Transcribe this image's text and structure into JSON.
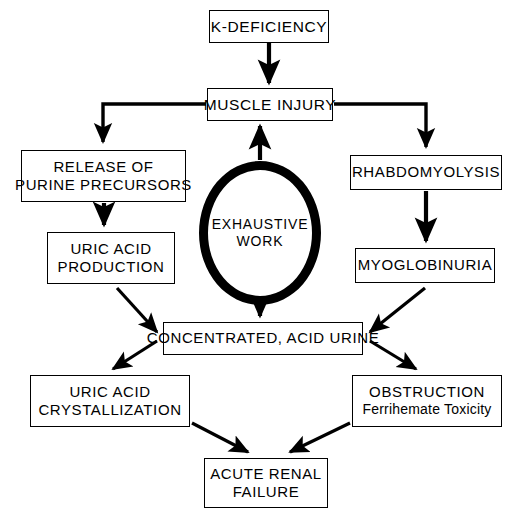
{
  "diagram": {
    "background_color": "#ffffff",
    "line_color": "#000000",
    "nodes": [
      {
        "id": "k_deficiency",
        "shape": "rect",
        "line1": "K-DEFICIENCY",
        "line2": ""
      },
      {
        "id": "muscle_injury",
        "shape": "rect",
        "line1": "MUSCLE INJURY",
        "line2": ""
      },
      {
        "id": "release_purine",
        "shape": "rect",
        "line1": "RELEASE OF",
        "line2": "PURINE PRECURSORS"
      },
      {
        "id": "rhabdomyolysis",
        "shape": "rect",
        "line1": "RHABDOMYOLYSIS",
        "line2": ""
      },
      {
        "id": "uric_acid_prod",
        "shape": "rect",
        "line1": "URIC ACID",
        "line2": "PRODUCTION"
      },
      {
        "id": "myoglobinuria",
        "shape": "rect",
        "line1": "MYOGLOBINURIA",
        "line2": ""
      },
      {
        "id": "exhaustive_work",
        "shape": "circle",
        "line1": "EXHAUSTIVE",
        "line2": "WORK"
      },
      {
        "id": "conc_acid_urine",
        "shape": "rect",
        "line1": "CONCENTRATED, ACID URINE",
        "line2": ""
      },
      {
        "id": "uric_acid_crys",
        "shape": "rect",
        "line1": "URIC ACID",
        "line2": "CRYSTALLIZATION"
      },
      {
        "id": "obstruction",
        "shape": "rect",
        "line1": "OBSTRUCTION",
        "line2": "Ferrihemate Toxicity"
      },
      {
        "id": "acute_renal",
        "shape": "rect",
        "line1": "ACUTE RENAL",
        "line2": "FAILURE"
      }
    ],
    "edges": [
      {
        "from": "k_deficiency",
        "to": "muscle_injury",
        "style": "straight-vertical"
      },
      {
        "from": "exhaustive_work",
        "to": "muscle_injury",
        "style": "straight-vertical-up"
      },
      {
        "from": "muscle_injury",
        "to": "release_purine",
        "style": "elbow-left"
      },
      {
        "from": "muscle_injury",
        "to": "rhabdomyolysis",
        "style": "elbow-right"
      },
      {
        "from": "release_purine",
        "to": "uric_acid_prod",
        "style": "straight-vertical"
      },
      {
        "from": "rhabdomyolysis",
        "to": "myoglobinuria",
        "style": "straight-vertical"
      },
      {
        "from": "exhaustive_work",
        "to": "conc_acid_urine",
        "style": "straight-vertical"
      },
      {
        "from": "uric_acid_prod",
        "to": "conc_acid_urine",
        "style": "diagonal-down-right"
      },
      {
        "from": "myoglobinuria",
        "to": "conc_acid_urine",
        "style": "diagonal-down-left"
      },
      {
        "from": "conc_acid_urine",
        "to": "uric_acid_crys",
        "style": "diagonal-down-left"
      },
      {
        "from": "conc_acid_urine",
        "to": "obstruction",
        "style": "diagonal-down-right"
      },
      {
        "from": "uric_acid_crys",
        "to": "acute_renal",
        "style": "diagonal-down-right"
      },
      {
        "from": "obstruction",
        "to": "acute_renal",
        "style": "diagonal-down-left"
      }
    ]
  }
}
